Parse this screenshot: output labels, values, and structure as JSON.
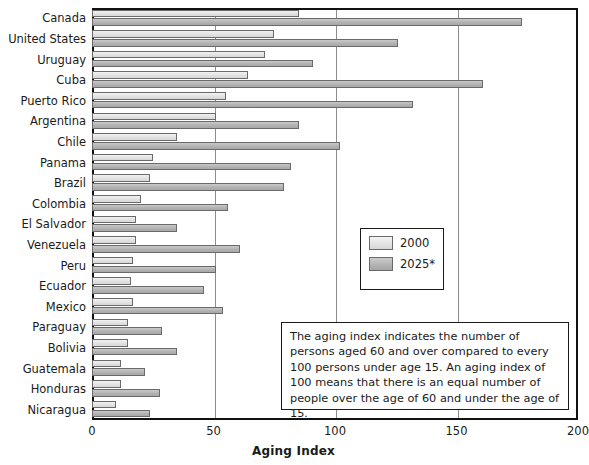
{
  "chart_data": {
    "type": "bar",
    "orientation": "horizontal",
    "title": "",
    "xlabel": "Aging Index",
    "ylabel": "",
    "xlim": [
      0,
      200
    ],
    "xticks": [
      "0",
      "50",
      "100",
      "150",
      "200"
    ],
    "grid": "vertical",
    "legend_position": "center-right",
    "categories": [
      "Canada",
      "United States",
      "Uruguay",
      "Cuba",
      "Puerto Rico",
      "Argentina",
      "Chile",
      "Panama",
      "Brazil",
      "Colombia",
      "El Salvador",
      "Venezuela",
      "Peru",
      "Ecuador",
      "Mexico",
      "Paraguay",
      "Bolivia",
      "Guatemala",
      "Honduras",
      "Nicaragua"
    ],
    "series": [
      {
        "name": "2000",
        "values": [
          85,
          75,
          71,
          64,
          55,
          51,
          35,
          25,
          24,
          20,
          18,
          18,
          17,
          16,
          17,
          15,
          15,
          12,
          12,
          10
        ]
      },
      {
        "name": "2025*",
        "values": [
          177,
          126,
          91,
          161,
          132,
          85,
          102,
          82,
          79,
          56,
          35,
          61,
          51,
          46,
          54,
          29,
          35,
          22,
          28,
          24
        ]
      }
    ],
    "colors": {
      "2000": "#e2e2e2",
      "2025*": "#b2b2b2",
      "border": "#6a6a6a",
      "grid": "#8d8d8d",
      "frame": "#111111"
    },
    "annotation": "The aging index indicates the number of persons aged 60 and over compared to every 100 persons under age 15. An aging index of 100 means that there is an equal number of people over the age of 60 and under the age of 15."
  },
  "legend": {
    "items": [
      {
        "label": "2000"
      },
      {
        "label": "2025*"
      }
    ]
  },
  "axis": {
    "x_title": "Aging Index",
    "ticks": [
      "0",
      "50",
      "100",
      "150",
      "200"
    ]
  },
  "note": {
    "text": "The aging index indicates the number of persons aged 60 and over compared to every 100 persons under age 15. An aging index of 100 means that there is an equal number of people over the age of 60 and under the age of 15."
  }
}
